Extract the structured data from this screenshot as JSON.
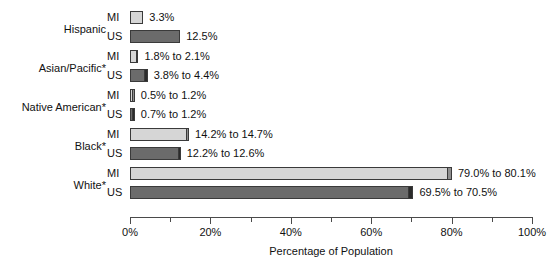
{
  "chart_data": {
    "type": "bar",
    "title": "",
    "xlabel": "Percentage of Population",
    "ylabel": "",
    "orientation": "horizontal",
    "xlim": [
      0,
      100
    ],
    "xticks": [
      0,
      20,
      40,
      60,
      80,
      100
    ],
    "xtick_labels": [
      "0%",
      "20%",
      "40%",
      "60%",
      "80%",
      "100%"
    ],
    "minor_tick_interval": 10,
    "grid": false,
    "legend_position": "none",
    "value_type": "range",
    "categories": [
      "Hispanic",
      "Asian/Pacific*",
      "Native American*",
      "Black*",
      "White*"
    ],
    "series": [
      {
        "name": "MI",
        "color": "#d6d6d6",
        "cap_color": "#8f8f8f",
        "values_low": [
          3.3,
          1.8,
          0.5,
          14.2,
          79.0
        ],
        "values_high": [
          3.3,
          2.1,
          1.2,
          14.7,
          80.1
        ],
        "labels": [
          "3.3%",
          "1.8% to 2.1%",
          "0.5% to 1.2%",
          "14.2% to 14.7%",
          "79.0% to 80.1%"
        ]
      },
      {
        "name": "US",
        "color": "#6b6b6b",
        "cap_color": "#2b2b2b",
        "values_low": [
          12.5,
          3.8,
          0.7,
          12.2,
          69.5
        ],
        "values_high": [
          12.5,
          4.4,
          1.2,
          12.6,
          70.5
        ],
        "labels": [
          "12.5%",
          "3.8% to 4.4%",
          "0.7% to 1.2%",
          "12.2% to 12.6%",
          "69.5% to 70.5%"
        ]
      }
    ]
  }
}
